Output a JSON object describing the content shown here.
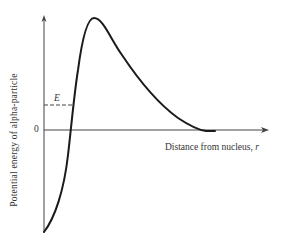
{
  "diagram": {
    "type": "potential-energy-curve",
    "y_axis_label": "Potential energy of alpha-particle",
    "x_axis_label": "Distance from nucleus, ",
    "x_axis_variable": "r",
    "origin_label": "0",
    "energy_level_label": "E",
    "colors": {
      "curve": "#1a1a1a",
      "axes": "#444444",
      "text": "#333333",
      "background": "#ffffff"
    }
  }
}
